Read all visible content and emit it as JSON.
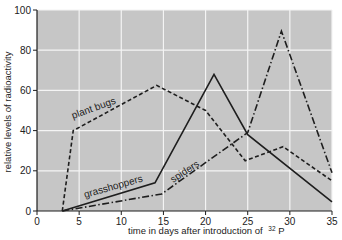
{
  "chart_data": {
    "type": "line",
    "title": "",
    "xlabel": "time in days after introduction of",
    "xlabel_isotope_mass": "32",
    "xlabel_isotope_symbol": "P",
    "ylabel": "relative levels of radioactivity",
    "xlim": [
      0,
      35
    ],
    "ylim": [
      0,
      100
    ],
    "xticks": [
      0,
      5,
      10,
      15,
      20,
      25,
      30,
      35
    ],
    "yticks": [
      0,
      20,
      40,
      60,
      80,
      100
    ],
    "xtick_labels": [
      "0",
      "5",
      "10",
      "15",
      "20",
      "25",
      "30",
      "35"
    ],
    "ytick_labels": [
      "0",
      "20",
      "40",
      "60",
      "80",
      "100"
    ],
    "grid": true,
    "legend": "inline labels",
    "colors": {
      "plot_background": "#c6c6c6",
      "grid": "#f4f4f4",
      "line": "#1e1e1e",
      "axis": "#1e1e1e"
    },
    "series": [
      {
        "name": "plant bugs",
        "style": "dashed",
        "x": [
          3,
          4.3,
          14.2,
          20,
          24.7,
          29.2,
          35
        ],
        "y": [
          0,
          40,
          62.5,
          50,
          25,
          32,
          15
        ]
      },
      {
        "name": "grasshoppers",
        "style": "solid",
        "x": [
          3,
          14,
          21,
          25,
          35
        ],
        "y": [
          0,
          14,
          68,
          38,
          4.5
        ]
      },
      {
        "name": "spiders",
        "style": "dash-dot",
        "x": [
          3,
          14.8,
          25,
          29,
          35
        ],
        "y": [
          0,
          8.5,
          39,
          89.5,
          19
        ]
      }
    ]
  }
}
